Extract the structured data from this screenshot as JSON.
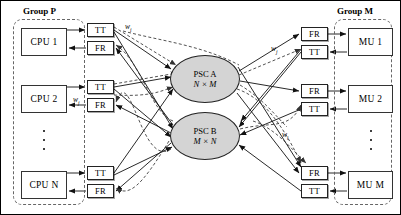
{
  "figure": {
    "groups": [
      {
        "id": "group-p",
        "label": "Group P",
        "x": 12,
        "y": 18,
        "w": 72,
        "h": 186,
        "label_x": 22,
        "label_y": 6
      },
      {
        "id": "group-m",
        "label": "Group M",
        "x": 333,
        "y": 18,
        "w": 58,
        "h": 186,
        "label_x": 337,
        "label_y": 6
      }
    ],
    "cpus": [
      {
        "label": "CPU 1",
        "x": 20,
        "y": 27,
        "w": 46,
        "h": 28
      },
      {
        "label": "CPU 2",
        "x": 20,
        "y": 84,
        "w": 46,
        "h": 28
      },
      {
        "label": "CPU N",
        "x": 20,
        "y": 170,
        "w": 46,
        "h": 28
      }
    ],
    "mus": [
      {
        "label": "MU 1",
        "x": 347,
        "y": 27,
        "w": 45,
        "h": 28
      },
      {
        "label": "MU 2",
        "x": 347,
        "y": 84,
        "w": 45,
        "h": 28
      },
      {
        "label": "MU M",
        "x": 347,
        "y": 170,
        "w": 45,
        "h": 28
      }
    ],
    "left_ifaces": [
      {
        "label": "TT",
        "x": 86,
        "y": 22,
        "w": 27,
        "h": 14
      },
      {
        "label": "FR",
        "x": 86,
        "y": 40,
        "w": 27,
        "h": 14
      },
      {
        "label": "TT",
        "x": 86,
        "y": 79,
        "w": 27,
        "h": 14
      },
      {
        "label": "FR",
        "x": 86,
        "y": 97,
        "w": 27,
        "h": 14
      },
      {
        "label": "TT",
        "x": 86,
        "y": 165,
        "w": 27,
        "h": 14
      },
      {
        "label": "FR",
        "x": 86,
        "y": 183,
        "w": 27,
        "h": 14
      }
    ],
    "right_ifaces": [
      {
        "label": "FR",
        "x": 300,
        "y": 26,
        "w": 27,
        "h": 14
      },
      {
        "label": "TT",
        "x": 300,
        "y": 44,
        "w": 27,
        "h": 14
      },
      {
        "label": "FR",
        "x": 300,
        "y": 83,
        "w": 27,
        "h": 14
      },
      {
        "label": "TT",
        "x": 300,
        "y": 101,
        "w": 27,
        "h": 14
      },
      {
        "label": "FR",
        "x": 300,
        "y": 165,
        "w": 27,
        "h": 14
      },
      {
        "label": "TT",
        "x": 300,
        "y": 183,
        "w": 27,
        "h": 14
      }
    ],
    "switches": [
      {
        "id": "psc-a",
        "line1": "PSC A",
        "line2": "N × M",
        "cx": 204,
        "cy": 78,
        "rx": 35,
        "ry": 24
      },
      {
        "id": "psc-b",
        "line1": "PSC B",
        "line2": "M × N",
        "cx": 204,
        "cy": 135,
        "rx": 35,
        "ry": 24
      }
    ],
    "weights": [
      {
        "base": "w",
        "sub": "i",
        "x": 124,
        "y": 22
      },
      {
        "base": "w",
        "sub": "j",
        "x": 72,
        "y": 95
      },
      {
        "base": "w",
        "sub": "j",
        "x": 270,
        "y": 44
      },
      {
        "base": "w",
        "sub": "i",
        "x": 281,
        "y": 130
      }
    ],
    "ellipses_vertical": [
      {
        "id": "cpu-ellipsis",
        "x": 41,
        "y": 129,
        "h": 20
      },
      {
        "id": "mu-ellipsis",
        "x": 368,
        "y": 129,
        "h": 20
      }
    ],
    "colors": {
      "switch_fill": "#d4d4d4",
      "stroke": "#222222",
      "dashed_group": "#666666",
      "background": "#ffffff"
    }
  }
}
